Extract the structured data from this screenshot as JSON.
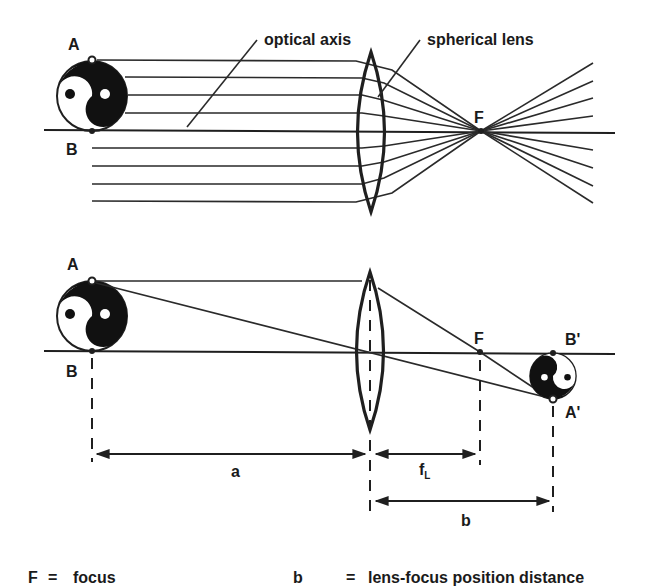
{
  "figure": {
    "top_diagram": {
      "labels": {
        "point_a": "A",
        "point_b": "B",
        "focus": "F",
        "optical_axis": "optical axis",
        "spherical_lens": "spherical lens"
      }
    },
    "bottom_diagram": {
      "labels": {
        "point_a": "A",
        "point_b": "B",
        "focus": "F",
        "image_b": "B'",
        "image_a": "A'",
        "distance_a": "a",
        "focal_length_main": "f",
        "focal_length_sub": "L",
        "distance_b": "b"
      }
    },
    "legend": [
      {
        "symbol": "F",
        "eq": "=",
        "text": "focus"
      },
      {
        "symbol": "b",
        "eq": "=",
        "text": "lens-focus position distance"
      }
    ],
    "colors": {
      "ink": "#1f1f1f",
      "background": "#ffffff"
    }
  }
}
